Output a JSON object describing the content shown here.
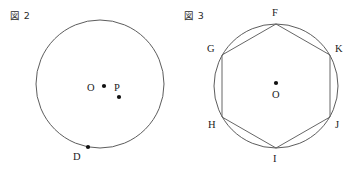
{
  "page": {
    "background_color": "#ffffff",
    "width": 355,
    "height": 172
  },
  "figures": [
    {
      "caption": "図 2",
      "caption_name": "figure-2-caption",
      "circle": {
        "cx": 100,
        "cy": 84,
        "r": 64
      },
      "points": [
        {
          "id": "O",
          "label": "O",
          "x": 104,
          "y": 86,
          "label_x": 87,
          "label_y": 83
        },
        {
          "id": "P",
          "label": "P",
          "x": 119,
          "y": 97,
          "label_x": 114,
          "label_y": 83
        },
        {
          "id": "D",
          "label": "D",
          "x": 88,
          "y": 147,
          "label_x": 73,
          "label_y": 152
        }
      ]
    },
    {
      "caption": "図 3",
      "caption_name": "figure-3-caption",
      "circle": {
        "cx": 98,
        "cy": 86,
        "r": 62
      },
      "polygon": {
        "name": "inscribed-regular-hexagon",
        "vertices": [
          "F",
          "K",
          "J",
          "I",
          "H",
          "G"
        ]
      },
      "points": [
        {
          "id": "F",
          "label": "F",
          "x": 98,
          "y": 24,
          "label_x": 94,
          "label_y": 8
        },
        {
          "id": "K",
          "label": "K",
          "x": 152,
          "y": 55,
          "label_x": 157,
          "label_y": 44
        },
        {
          "id": "J",
          "label": "J",
          "x": 152,
          "y": 117,
          "label_x": 157,
          "label_y": 120
        },
        {
          "id": "I",
          "label": "I",
          "x": 98,
          "y": 148,
          "label_x": 95,
          "label_y": 154
        },
        {
          "id": "H",
          "label": "H",
          "x": 44,
          "y": 117,
          "label_x": 30,
          "label_y": 120
        },
        {
          "id": "G",
          "label": "G",
          "x": 44,
          "y": 55,
          "label_x": 29,
          "label_y": 44
        },
        {
          "id": "O",
          "label": "O",
          "x": 98,
          "y": 83,
          "label_x": 94,
          "label_y": 90
        }
      ]
    }
  ],
  "colors": {
    "stroke": "#4a4a4a",
    "polygon_stroke": "#555555",
    "dot": "#111111",
    "text": "#1a1a1a"
  }
}
